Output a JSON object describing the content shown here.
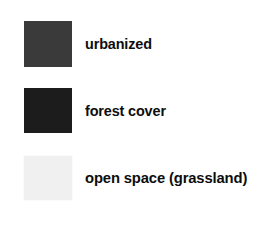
{
  "legend": {
    "background_color": "#ffffff",
    "text_color": "#0d0d0d",
    "entries": [
      {
        "label": "urbanized",
        "swatch_color": "#3a3a3a",
        "swatch_name": "urbanized-swatch"
      },
      {
        "label": "forest cover",
        "swatch_color": "#1c1c1c",
        "swatch_name": "forest-cover-swatch"
      },
      {
        "label": "open space (grassland)",
        "swatch_color": "#f0f0f0",
        "swatch_name": "open-space-swatch"
      }
    ]
  }
}
